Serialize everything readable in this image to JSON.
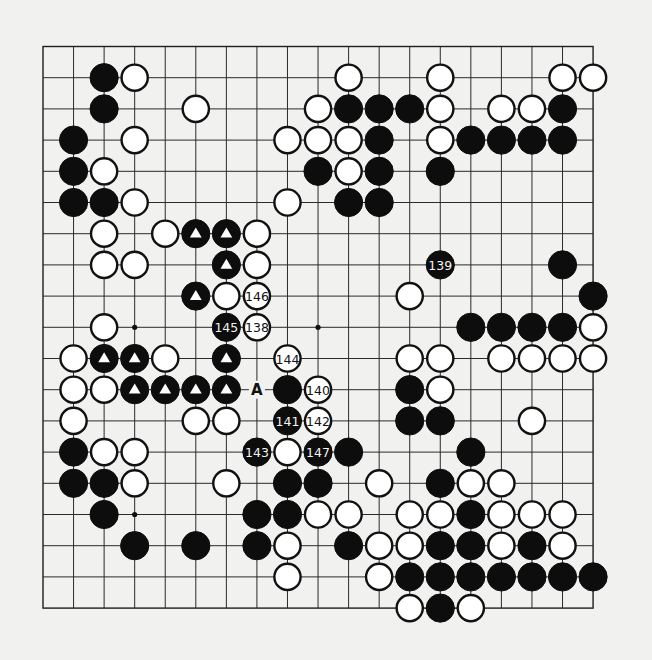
{
  "board": {
    "size": 19,
    "origin_x": 43,
    "origin_y": 46.5,
    "spacing_x": 30.56,
    "spacing_y": 31.2,
    "stone_radius": 13.5,
    "colors": {
      "background": "#f1f1f0",
      "line": "#2a2a2a",
      "black": "#0d0d0d",
      "white": "#ffffff"
    },
    "star_points": [
      [
        3,
        3
      ],
      [
        9,
        3
      ],
      [
        15,
        3
      ],
      [
        3,
        9
      ],
      [
        9,
        9
      ],
      [
        15,
        9
      ],
      [
        3,
        15
      ],
      [
        9,
        15
      ],
      [
        15,
        15
      ]
    ],
    "black_stones": [
      [
        2,
        1
      ],
      [
        2,
        2
      ],
      [
        10,
        2
      ],
      [
        11,
        2
      ],
      [
        12,
        2
      ],
      [
        17,
        2
      ],
      [
        1,
        3
      ],
      [
        11,
        3
      ],
      [
        14,
        3
      ],
      [
        15,
        3
      ],
      [
        16,
        3
      ],
      [
        17,
        3
      ],
      [
        1,
        4
      ],
      [
        9,
        4
      ],
      [
        11,
        4
      ],
      [
        13,
        4
      ],
      [
        1,
        5
      ],
      [
        2,
        5
      ],
      [
        10,
        5
      ],
      [
        11,
        5
      ],
      [
        17,
        7
      ],
      [
        18,
        8
      ],
      [
        14,
        9
      ],
      [
        15,
        9
      ],
      [
        16,
        9
      ],
      [
        17,
        9
      ],
      [
        8,
        11
      ],
      [
        12,
        11
      ],
      [
        12,
        12
      ],
      [
        13,
        12
      ],
      [
        1,
        13
      ],
      [
        10,
        13
      ],
      [
        14,
        13
      ],
      [
        1,
        14
      ],
      [
        2,
        14
      ],
      [
        8,
        14
      ],
      [
        9,
        14
      ],
      [
        13,
        14
      ],
      [
        2,
        15
      ],
      [
        7,
        15
      ],
      [
        8,
        15
      ],
      [
        14,
        15
      ],
      [
        3,
        16
      ],
      [
        5,
        16
      ],
      [
        7,
        16
      ],
      [
        10,
        16
      ],
      [
        13,
        16
      ],
      [
        14,
        16
      ],
      [
        16,
        16
      ],
      [
        12,
        17
      ],
      [
        13,
        17
      ],
      [
        14,
        17
      ],
      [
        15,
        17
      ],
      [
        16,
        17
      ],
      [
        17,
        17
      ],
      [
        18,
        17
      ],
      [
        13,
        18
      ]
    ],
    "black_triangle_stones": [
      [
        5,
        6
      ],
      [
        6,
        6
      ],
      [
        6,
        7
      ],
      [
        5,
        8
      ],
      [
        2,
        10
      ],
      [
        3,
        10
      ],
      [
        6,
        10
      ],
      [
        3,
        11
      ],
      [
        4,
        11
      ],
      [
        5,
        11
      ],
      [
        6,
        11
      ]
    ],
    "white_stones": [
      [
        3,
        1
      ],
      [
        10,
        1
      ],
      [
        13,
        1
      ],
      [
        17,
        1
      ],
      [
        18,
        1
      ],
      [
        5,
        2
      ],
      [
        9,
        2
      ],
      [
        13,
        2
      ],
      [
        15,
        2
      ],
      [
        16,
        2
      ],
      [
        3,
        3
      ],
      [
        8,
        3
      ],
      [
        9,
        3
      ],
      [
        10,
        3
      ],
      [
        13,
        3
      ],
      [
        2,
        4
      ],
      [
        10,
        4
      ],
      [
        3,
        5
      ],
      [
        8,
        5
      ],
      [
        2,
        6
      ],
      [
        4,
        6
      ],
      [
        7,
        6
      ],
      [
        2,
        7
      ],
      [
        3,
        7
      ],
      [
        7,
        7
      ],
      [
        6,
        8
      ],
      [
        12,
        8
      ],
      [
        2,
        9
      ],
      [
        18,
        9
      ],
      [
        1,
        10
      ],
      [
        4,
        10
      ],
      [
        12,
        10
      ],
      [
        13,
        10
      ],
      [
        15,
        10
      ],
      [
        16,
        10
      ],
      [
        17,
        10
      ],
      [
        18,
        10
      ],
      [
        1,
        11
      ],
      [
        2,
        11
      ],
      [
        13,
        11
      ],
      [
        1,
        12
      ],
      [
        5,
        12
      ],
      [
        6,
        12
      ],
      [
        16,
        12
      ],
      [
        2,
        13
      ],
      [
        3,
        13
      ],
      [
        8,
        13
      ],
      [
        3,
        14
      ],
      [
        6,
        14
      ],
      [
        11,
        14
      ],
      [
        14,
        14
      ],
      [
        15,
        14
      ],
      [
        9,
        15
      ],
      [
        10,
        15
      ],
      [
        12,
        15
      ],
      [
        13,
        15
      ],
      [
        15,
        15
      ],
      [
        16,
        15
      ],
      [
        17,
        15
      ],
      [
        8,
        16
      ],
      [
        11,
        16
      ],
      [
        12,
        16
      ],
      [
        15,
        16
      ],
      [
        17,
        16
      ],
      [
        8,
        17
      ],
      [
        11,
        17
      ],
      [
        12,
        18
      ],
      [
        14,
        18
      ]
    ],
    "numbered_moves": [
      {
        "n": "138",
        "color": "white",
        "x": 7,
        "y": 9
      },
      {
        "n": "139",
        "color": "black",
        "x": 13,
        "y": 7
      },
      {
        "n": "140",
        "color": "white",
        "x": 9,
        "y": 11
      },
      {
        "n": "141",
        "color": "black",
        "x": 8,
        "y": 12
      },
      {
        "n": "142",
        "color": "white",
        "x": 9,
        "y": 12
      },
      {
        "n": "143",
        "color": "black",
        "x": 7,
        "y": 13
      },
      {
        "n": "144",
        "color": "white",
        "x": 8,
        "y": 10
      },
      {
        "n": "145",
        "color": "black",
        "x": 6,
        "y": 9
      },
      {
        "n": "146",
        "color": "white",
        "x": 7,
        "y": 8
      },
      {
        "n": "147",
        "color": "black",
        "x": 9,
        "y": 13
      }
    ],
    "labels": [
      {
        "text": "A",
        "x": 7,
        "y": 11
      }
    ]
  }
}
